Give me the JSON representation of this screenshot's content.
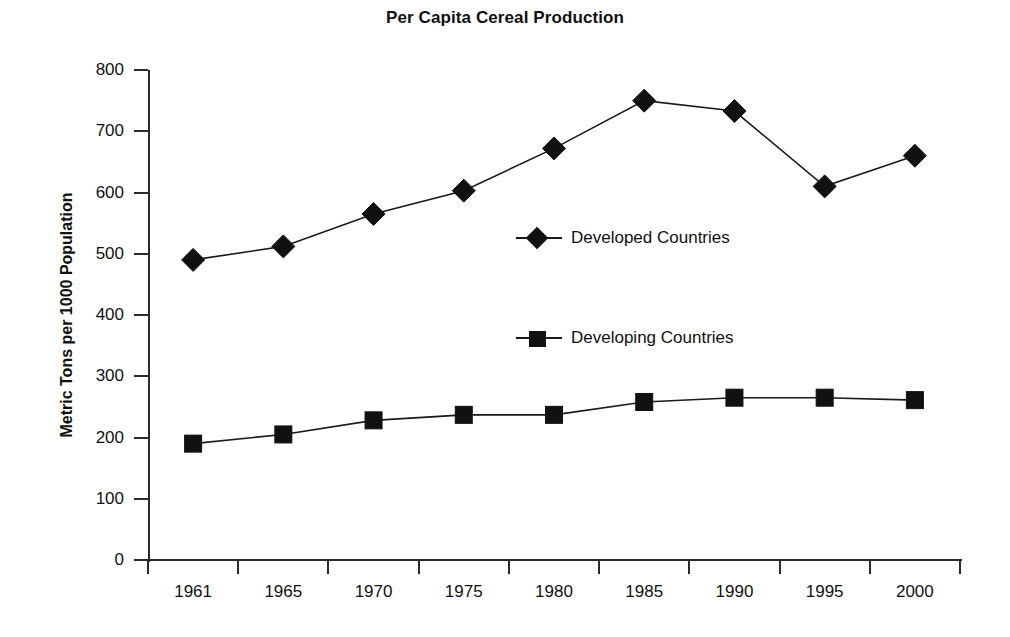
{
  "chart_data": {
    "type": "line",
    "title": "Per Capita Cereal Production",
    "xlabel": "",
    "ylabel": "Metric Tons per 1000 Population",
    "categories": [
      "1961",
      "1965",
      "1970",
      "1975",
      "1980",
      "1985",
      "1990",
      "1995",
      "2000"
    ],
    "ylim": [
      0,
      800
    ],
    "ytick_values": [
      0,
      100,
      200,
      300,
      400,
      500,
      600,
      700,
      800
    ],
    "ytick_labels": [
      "0",
      "100",
      "200",
      "300",
      "400",
      "500",
      "600",
      "700",
      "800"
    ],
    "grid": false,
    "legend_position": "inside-center-right",
    "series": [
      {
        "name": "Developed Countries",
        "marker": "diamond",
        "color": "#111111",
        "values": [
          490,
          512,
          565,
          603,
          672,
          750,
          733,
          610,
          660
        ]
      },
      {
        "name": "Developing Countries",
        "marker": "square",
        "color": "#111111",
        "values": [
          190,
          205,
          228,
          237,
          237,
          258,
          265,
          265,
          261
        ]
      }
    ]
  },
  "legend": {
    "developed_label": "Developed Countries",
    "developing_label": "Developing Countries"
  },
  "colors": {
    "ink": "#111111",
    "axis": "#2b2b2b",
    "background": "#ffffff"
  }
}
